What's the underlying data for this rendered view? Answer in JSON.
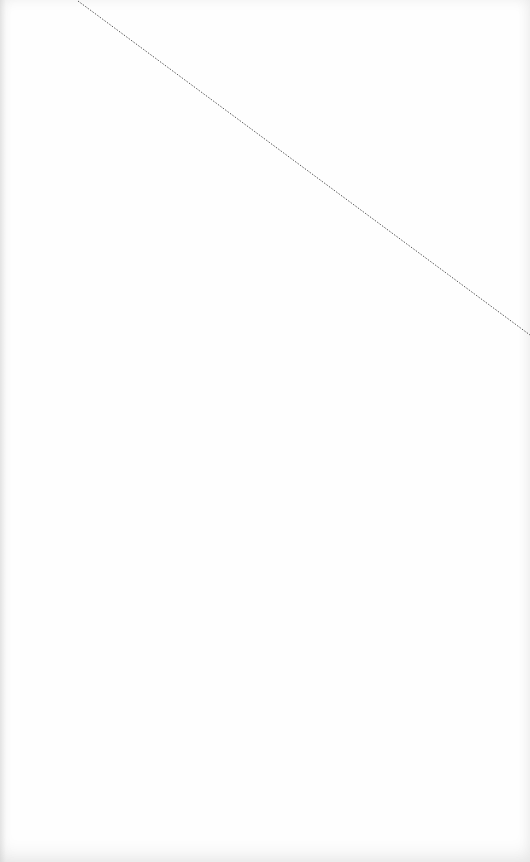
{
  "page": {
    "background_color": "#fefefe"
  },
  "diagonal_rule": {
    "style": "dotted",
    "color": "#555555",
    "x1": 78,
    "y1": 1,
    "x2": 530,
    "y2": 335
  }
}
